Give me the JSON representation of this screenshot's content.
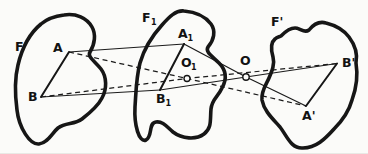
{
  "figure": {
    "background": "#fbfbf9",
    "ink": "#161616"
  },
  "labels": {
    "f": "F",
    "f1": {
      "main": "F",
      "sub": "1"
    },
    "f_prime": "F'",
    "a": "A",
    "b": "B",
    "a1": {
      "main": "A",
      "sub": "1"
    },
    "b1": {
      "main": "B",
      "sub": "1"
    },
    "o1": {
      "main": "O",
      "sub": "1"
    },
    "o": "O",
    "a_prime": "A'",
    "b_prime": "B'"
  },
  "diagram": {
    "regions": [
      "F",
      "F1",
      "F'"
    ],
    "marked_points": [
      "A",
      "B",
      "A1",
      "B1",
      "O1",
      "O",
      "A'",
      "B'"
    ],
    "solid_segments": [
      "A-B",
      "A1-B1",
      "A'-B'",
      "A-A1",
      "B-B1",
      "A1-O-A'",
      "B1-O-B'"
    ],
    "dashed_segments": [
      "A-O1-A'",
      "B-O1-B'"
    ],
    "open_circle_markers": [
      "O1",
      "O"
    ]
  }
}
